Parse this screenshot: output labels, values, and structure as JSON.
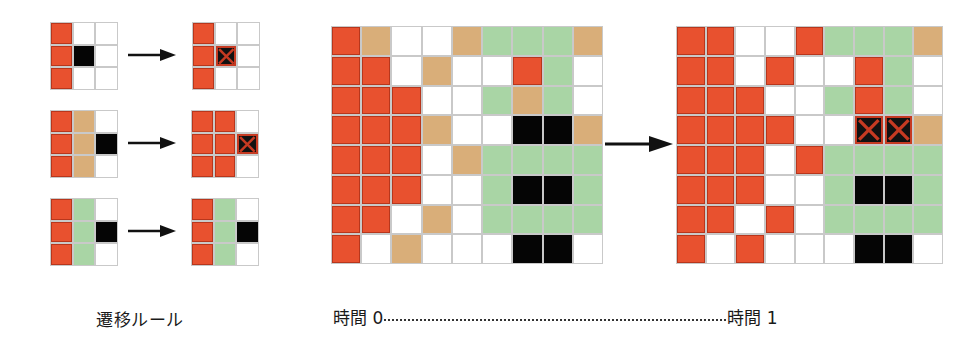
{
  "legend": {
    "R": "red-cell",
    "T": "tan-cell",
    "G": "green-cell",
    "K": "black-cell",
    "W": "white-cell",
    "X": "crossed-black-cell"
  },
  "colors": {
    "red": "#e8512f",
    "tan": "#d9ae79",
    "green": "#a9d5a5",
    "black": "#050505",
    "white": "#ffffff",
    "gridline": "#c9c9c9"
  },
  "rules": [
    {
      "before": [
        [
          "R",
          "W",
          "W"
        ],
        [
          "R",
          "K",
          "W"
        ],
        [
          "R",
          "W",
          "W"
        ]
      ],
      "after": [
        [
          "R",
          "W",
          "W"
        ],
        [
          "R",
          "X",
          "W"
        ],
        [
          "R",
          "W",
          "W"
        ]
      ]
    },
    {
      "before": [
        [
          "R",
          "T",
          "W"
        ],
        [
          "R",
          "T",
          "K"
        ],
        [
          "R",
          "T",
          "W"
        ]
      ],
      "after": [
        [
          "R",
          "R",
          "W"
        ],
        [
          "R",
          "R",
          "X"
        ],
        [
          "R",
          "R",
          "W"
        ]
      ]
    },
    {
      "before": [
        [
          "R",
          "G",
          "W"
        ],
        [
          "R",
          "G",
          "K"
        ],
        [
          "R",
          "G",
          "W"
        ]
      ],
      "after": [
        [
          "R",
          "G",
          "W"
        ],
        [
          "R",
          "G",
          "K"
        ],
        [
          "R",
          "G",
          "W"
        ]
      ]
    }
  ],
  "time0": [
    [
      "R",
      "T",
      "W",
      "W",
      "T",
      "G",
      "G",
      "G",
      "T"
    ],
    [
      "R",
      "R",
      "W",
      "T",
      "W",
      "W",
      "R",
      "G",
      "W"
    ],
    [
      "R",
      "R",
      "R",
      "W",
      "W",
      "G",
      "T",
      "G",
      "W"
    ],
    [
      "R",
      "R",
      "R",
      "T",
      "W",
      "W",
      "K",
      "K",
      "T"
    ],
    [
      "R",
      "R",
      "R",
      "W",
      "T",
      "G",
      "G",
      "G",
      "G"
    ],
    [
      "R",
      "R",
      "R",
      "W",
      "W",
      "G",
      "K",
      "K",
      "G"
    ],
    [
      "R",
      "R",
      "W",
      "T",
      "W",
      "G",
      "G",
      "G",
      "G"
    ],
    [
      "R",
      "W",
      "T",
      "W",
      "W",
      "W",
      "K",
      "K",
      "W"
    ]
  ],
  "time1": [
    [
      "R",
      "R",
      "W",
      "W",
      "R",
      "G",
      "G",
      "G",
      "T"
    ],
    [
      "R",
      "R",
      "W",
      "R",
      "W",
      "W",
      "R",
      "G",
      "W"
    ],
    [
      "R",
      "R",
      "R",
      "W",
      "W",
      "G",
      "R",
      "G",
      "W"
    ],
    [
      "R",
      "R",
      "R",
      "R",
      "W",
      "W",
      "X",
      "X",
      "T"
    ],
    [
      "R",
      "R",
      "R",
      "W",
      "R",
      "G",
      "G",
      "G",
      "G"
    ],
    [
      "R",
      "R",
      "R",
      "W",
      "W",
      "G",
      "K",
      "K",
      "G"
    ],
    [
      "R",
      "R",
      "W",
      "R",
      "W",
      "G",
      "G",
      "G",
      "G"
    ],
    [
      "R",
      "W",
      "R",
      "W",
      "W",
      "W",
      "K",
      "K",
      "W"
    ]
  ],
  "labels": {
    "rules_caption": "遷移ルール",
    "time_start": "時間 0",
    "time_end": "時間 1"
  }
}
